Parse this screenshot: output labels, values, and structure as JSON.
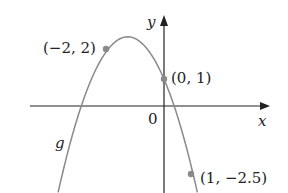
{
  "diagram": {
    "function_name": "g",
    "equation_implied": "y = -x^2 - 2.5x + 1",
    "axes": {
      "x_label": "x",
      "y_label": "y",
      "origin_label": "0"
    },
    "points": [
      {
        "x": -2,
        "y": 2,
        "label": "(−2, 2)"
      },
      {
        "x": 0,
        "y": 1,
        "label": "(0, 1)"
      },
      {
        "x": 1,
        "y": -2.5,
        "label": "(1, −2.5)"
      }
    ],
    "colors": {
      "curve": "#8a8a8a",
      "axes": "#222222",
      "points": "#8a8a8a"
    }
  }
}
